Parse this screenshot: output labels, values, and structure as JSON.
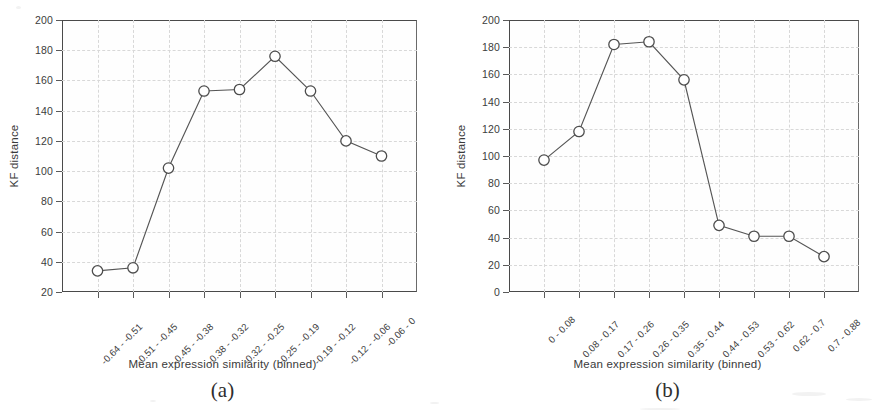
{
  "figure": {
    "panels": [
      {
        "caption": "(a)",
        "xlabel": "Mean expression similarity (binned)",
        "ylabel": "KF distance"
      },
      {
        "caption": "(b)",
        "xlabel": "Mean expression similarity (binned)",
        "ylabel": "KF distance"
      }
    ]
  },
  "chart_data": [
    {
      "type": "line",
      "title": "",
      "panel_label": "(a)",
      "xlabel": "Mean expression similarity (binned)",
      "ylabel": "KF distance",
      "categories": [
        "-0.64 - -0.51",
        "-0.51 - -0.45",
        "-0.45 - -0.38",
        "-0.38 - -0.32",
        "-0.32 - -0.25",
        "-0.25 - -0.19",
        "-0.19 - -0.12",
        "-0.12 - -0.06",
        "-0.06 - 0"
      ],
      "values": [
        34,
        36,
        102,
        153,
        154,
        176,
        153,
        120,
        110
      ],
      "ylim": [
        20,
        200
      ],
      "yticks": [
        20,
        40,
        60,
        80,
        100,
        120,
        140,
        160,
        180,
        200
      ],
      "grid": true,
      "legend": "none",
      "marker": "open-circle"
    },
    {
      "type": "line",
      "title": "",
      "panel_label": "(b)",
      "xlabel": "Mean expression similarity (binned)",
      "ylabel": "KF distance",
      "categories": [
        "0 - 0.08",
        "0.08 - 0.17",
        "0.17 - 0.26",
        "0.26 - 0.35",
        "0.35 - 0.44",
        "0.44 - 0.53",
        "0.53 - 0.62",
        "0.62 - 0.7",
        "0.7 - 0.88"
      ],
      "values": [
        97,
        118,
        182,
        184,
        156,
        49,
        41,
        41,
        26
      ],
      "ylim": [
        0,
        200
      ],
      "yticks": [
        0,
        20,
        40,
        60,
        80,
        100,
        120,
        140,
        160,
        180,
        200
      ],
      "grid": true,
      "legend": "none",
      "marker": "open-circle"
    }
  ]
}
